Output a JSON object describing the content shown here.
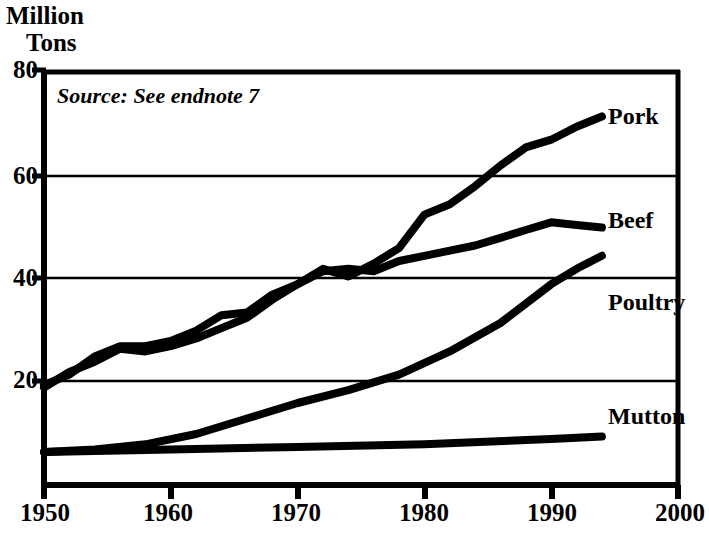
{
  "chart_data": {
    "type": "line",
    "title": "",
    "subtitle": "",
    "ylabel_line1": "Million",
    "ylabel_line2": "Tons",
    "xlabel": "",
    "annotation": "Source: See endnote 7",
    "xlim": [
      1950,
      2000
    ],
    "ylim": [
      0,
      80
    ],
    "yticks": [
      20,
      40,
      60,
      80
    ],
    "ytick_labels": [
      "20",
      "40",
      "60",
      "80"
    ],
    "xticks": [
      1950,
      1960,
      1970,
      1980,
      1990,
      2000
    ],
    "xtick_labels": [
      "1950",
      "1960",
      "1970",
      "1980",
      "1990",
      "2000"
    ],
    "grid": "horizontal",
    "legend_position": "right-inline-labels",
    "line_color": "#000000",
    "series": [
      {
        "name": "Pork",
        "label": "Pork",
        "x": [
          1950,
          1952,
          1954,
          1956,
          1958,
          1960,
          1962,
          1964,
          1966,
          1968,
          1970,
          1972,
          1974,
          1976,
          1978,
          1980,
          1982,
          1984,
          1986,
          1988,
          1990,
          1992,
          1994
        ],
        "values": [
          18.5,
          21.5,
          23.5,
          26.0,
          25.5,
          26.5,
          28.0,
          30.0,
          32.0,
          35.5,
          38.5,
          41.5,
          40.0,
          42.5,
          45.5,
          52.0,
          54.0,
          57.5,
          61.5,
          65.0,
          66.5,
          69.0,
          71.0
        ]
      },
      {
        "name": "Beef",
        "label": "Beef",
        "x": [
          1950,
          1952,
          1954,
          1956,
          1958,
          1960,
          1962,
          1964,
          1966,
          1968,
          1970,
          1972,
          1974,
          1976,
          1978,
          1980,
          1982,
          1984,
          1986,
          1988,
          1990,
          1992,
          1994
        ],
        "values": [
          19.0,
          21.0,
          24.5,
          26.5,
          26.5,
          27.5,
          29.5,
          32.5,
          33.0,
          36.5,
          38.5,
          41.0,
          41.5,
          41.0,
          43.0,
          44.0,
          45.0,
          46.0,
          47.5,
          49.0,
          50.5,
          50.0,
          49.5
        ]
      },
      {
        "name": "Poultry",
        "label": "Poultry",
        "x": [
          1950,
          1954,
          1958,
          1962,
          1966,
          1970,
          1974,
          1978,
          1982,
          1986,
          1990,
          1992,
          1994
        ],
        "values": [
          6.0,
          6.5,
          7.5,
          9.5,
          12.5,
          15.5,
          18.0,
          21.0,
          25.5,
          31.0,
          38.5,
          41.5,
          44.0
        ]
      },
      {
        "name": "Mutton",
        "label": "Mutton",
        "x": [
          1950,
          1960,
          1970,
          1980,
          1990,
          1994
        ],
        "values": [
          6.0,
          6.5,
          7.0,
          7.5,
          8.5,
          9.0
        ]
      }
    ]
  },
  "labels": {
    "pork": "Pork",
    "beef": "Beef",
    "poultry": "Poultry",
    "mutton": "Mutton"
  }
}
